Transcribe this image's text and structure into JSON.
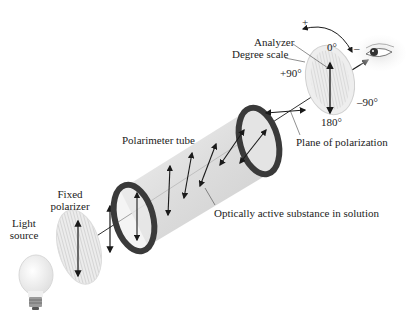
{
  "labels": {
    "light_source": [
      "Light",
      "source"
    ],
    "fixed_polarizer": [
      "Fixed",
      "polarizer"
    ],
    "polarimeter_tube": "Polarimeter tube",
    "optically_active": "Optically active substance in solution",
    "plane_of_polarization": "Plane of polarization",
    "analyzer": "Analyzer",
    "degree_scale": "Degree scale",
    "deg_0": "0°",
    "deg_plus90": "+90°",
    "deg_minus90": "–90°",
    "deg_180": "180°",
    "rotation_plus": "+",
    "rotation_minus": "–"
  },
  "colors": {
    "ring": "#3a3a3a",
    "tube": "#d9d9d9",
    "disc": "#e6e6e6",
    "line": "#1a1a1a"
  }
}
